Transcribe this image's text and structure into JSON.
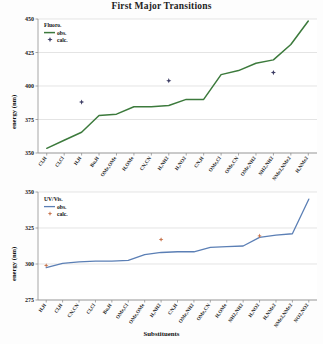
{
  "figure": {
    "title": "First Major Transitions",
    "xlabel": "Substituents",
    "ylabel": "energy (nm)"
  },
  "chart_data": [
    {
      "type": "line",
      "title": "First Major Transitions",
      "panel": "top",
      "xlabel": "Substituents",
      "ylabel": "energy (nm)",
      "ylim": [
        350,
        450
      ],
      "yticks": [
        350,
        375,
        400,
        425,
        450
      ],
      "grid": true,
      "legend_position": "top-left",
      "legend_title": "Fluoro.",
      "series": [
        {
          "name": "obs.",
          "style": "line",
          "color": "#3c7a3c",
          "categories": [
            "Cl,H",
            "Cl,Cl",
            "H,H",
            "Bu,H",
            "OMe,OMe",
            "H,OMe",
            "CN,CN",
            "H,NH2",
            "H,NO2",
            "CN,H",
            "OMe,Cl",
            "OMe,CN",
            "OMe,NH2",
            "NH2,NH2",
            "NMe2,NMe2",
            "H,NMe2"
          ],
          "values": [
            353.5,
            359.5,
            365.5,
            378.0,
            379.0,
            384.5,
            384.5,
            385.5,
            390.0,
            390.0,
            408.5,
            411.5,
            417.0,
            419.5,
            431.0,
            448.5
          ]
        },
        {
          "name": "calc.",
          "style": "marker",
          "color": "#3c3c64",
          "points": [
            {
              "x": "H,H",
              "y": 388.0
            },
            {
              "x": "H,NH2",
              "y": 404.0
            },
            {
              "x": "NH2,NH2",
              "y": 410.0
            }
          ]
        }
      ]
    },
    {
      "type": "line",
      "panel": "bottom",
      "xlabel": "Substituents",
      "ylabel": "energy (nm)",
      "ylim": [
        275,
        350
      ],
      "yticks": [
        275,
        300,
        325,
        350
      ],
      "grid": true,
      "legend_position": "top-left",
      "legend_title": "UV/Vis.",
      "series": [
        {
          "name": "obs.",
          "style": "line",
          "color": "#5b7fb5",
          "categories": [
            "H,H",
            "Cl,H",
            "CN,CN",
            "Cl,Cl",
            "Bu,H",
            "OMe,Cl",
            "OMe,OMe",
            "H,NH2",
            "CN,H",
            "OMe,NH2",
            "OMe,CN",
            "H,OMe",
            "NH2,NH2",
            "H,NO2",
            "H,NMe2",
            "NMe2,NMe2",
            "NO2,NO2"
          ],
          "values": [
            297.5,
            300.5,
            301.5,
            302.0,
            302.0,
            302.5,
            306.5,
            308.0,
            308.5,
            308.5,
            311.5,
            312.0,
            312.5,
            318.5,
            320.0,
            321.0,
            345.0
          ]
        },
        {
          "name": "calc.",
          "style": "marker",
          "color": "#c8764f",
          "points": [
            {
              "x": "H,H",
              "y": 299.0
            },
            {
              "x": "H,NH2",
              "y": 317.0
            },
            {
              "x": "H,NO2",
              "y": 319.5
            }
          ]
        }
      ]
    }
  ],
  "top_panel": {
    "legend_title": "Fluoro.",
    "legend_obs": "obs.",
    "legend_calc": "calc.",
    "ylabel": "energy (nm)",
    "yticks": [
      "350",
      "375",
      "400",
      "425",
      "450"
    ],
    "xticks": [
      "Cl,H",
      "Cl,Cl",
      "H,H",
      "Bu,H",
      "OMe,OMe",
      "H,OMe",
      "CN,CN",
      "H,NH2",
      "H,NO2",
      "CN,H",
      "OMe,Cl",
      "OMe,CN",
      "OMe,NH2",
      "NH2,NH2",
      "NMe2,NMe2",
      "H,NMe2"
    ]
  },
  "bottom_panel": {
    "legend_title": "UV/Vis.",
    "legend_obs": "obs.",
    "legend_calc": "calc.",
    "ylabel": "energy (nm)",
    "yticks": [
      "275",
      "300",
      "325",
      "350"
    ],
    "xticks": [
      "H,H",
      "Cl,H",
      "CN,CN",
      "Cl,Cl",
      "Bu,H",
      "OMe,Cl",
      "OMe,OMe",
      "H,NH2",
      "CN,H",
      "OMe,NH2",
      "OMe,CN",
      "H,OMe",
      "NH2,NH2",
      "H,NO2",
      "H,NMe2",
      "NMe2,NMe2",
      "NO2,NO2"
    ]
  }
}
